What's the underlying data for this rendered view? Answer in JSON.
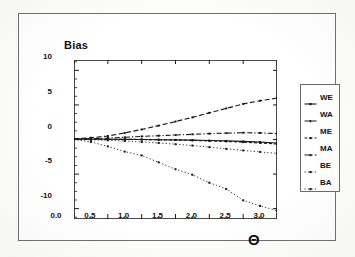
{
  "figure": {
    "background_color": "#ffffff",
    "border_color": "#6e6e6e",
    "ink_color": "#1a1a1a"
  },
  "chart_data": {
    "type": "line",
    "title": "",
    "ylabel": "Bias",
    "xlabel": "Θ",
    "xlim": [
      0.0,
      3.0
    ],
    "ylim": [
      -11.5,
      11.5
    ],
    "grid": false,
    "legend_position": "right-outside",
    "xticks": [
      0.0,
      0.5,
      1.0,
      1.5,
      2.0,
      2.5,
      3.0
    ],
    "xtick_labels": [
      "0.0",
      "0.5",
      "1.0",
      "1.5",
      "2.0",
      "2.5",
      "3.0"
    ],
    "xminor_step": 0.25,
    "yticks": [
      10,
      5,
      0,
      -5,
      -10
    ],
    "ytick_labels": [
      "10",
      "5",
      "0",
      "-5",
      "-10"
    ],
    "yminor_step": 1.25,
    "x": [
      0.0,
      0.25,
      0.5,
      0.75,
      1.0,
      1.25,
      1.5,
      1.75,
      2.0,
      2.25,
      2.5,
      2.75,
      3.0
    ],
    "series": [
      {
        "name": "WE",
        "label": "WE",
        "style": "solid",
        "marker": "square",
        "color": "#1a1a1a",
        "values": [
          0.05,
          0.05,
          0.04,
          0.02,
          0.0,
          -0.03,
          -0.06,
          -0.1,
          -0.15,
          -0.2,
          -0.28,
          -0.37,
          -0.5
        ]
      },
      {
        "name": "WA",
        "label": "WA",
        "style": "dashed",
        "marker": "square",
        "color": "#1a1a1a",
        "values": [
          0.1,
          0.25,
          0.5,
          0.95,
          1.45,
          2.0,
          2.6,
          3.2,
          3.85,
          4.5,
          5.15,
          5.6,
          6.0
        ]
      },
      {
        "name": "ME",
        "label": "ME",
        "style": "dashed-short",
        "marker": "square",
        "color": "#1a1a1a",
        "values": [
          0.05,
          0.05,
          0.04,
          0.02,
          0.0,
          -0.04,
          -0.08,
          -0.13,
          -0.2,
          -0.28,
          -0.38,
          -0.5,
          -0.65
        ]
      },
      {
        "name": "MA",
        "label": "MA",
        "style": "dash-dot",
        "marker": "square",
        "color": "#1a1a1a",
        "values": [
          0.05,
          0.12,
          0.2,
          0.32,
          0.45,
          0.55,
          0.65,
          0.75,
          0.85,
          0.92,
          0.98,
          0.95,
          0.85
        ]
      },
      {
        "name": "BE",
        "label": "BE",
        "style": "dotted",
        "marker": "square",
        "color": "#1a1a1a",
        "values": [
          0.0,
          -0.05,
          -0.12,
          -0.22,
          -0.35,
          -0.5,
          -0.68,
          -0.88,
          -1.1,
          -1.35,
          -1.58,
          -1.8,
          -2.0
        ]
      },
      {
        "name": "BA",
        "label": "BA",
        "style": "dotted",
        "marker": "square",
        "color": "#1a1a1a",
        "values": [
          0.0,
          -0.35,
          -1.0,
          -1.75,
          -2.3,
          -3.3,
          -4.3,
          -5.1,
          -6.25,
          -7.15,
          -8.8,
          -9.6,
          -10.3
        ]
      }
    ]
  }
}
